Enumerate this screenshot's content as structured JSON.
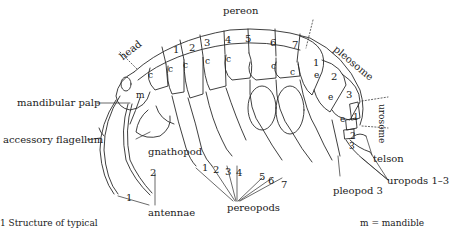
{
  "figure": {
    "region_labels": {
      "head": "head",
      "pereon": "pereon",
      "pleosome": "pleosome",
      "urosome": "urosome"
    },
    "pereon_segments": [
      "1",
      "2",
      "3",
      "4",
      "5",
      "6",
      "7"
    ],
    "coxa_marker": "c",
    "pleosome_segments": [
      "1",
      "2",
      "3"
    ],
    "epimeron_marker": "e",
    "urosome_segments": [
      "1",
      "2",
      "3"
    ],
    "mandible_marker": "m",
    "callouts": {
      "mandibular_palp": "mandibular palp",
      "accessory_flagellum": "accessory flagellum",
      "gnathopod": "gnathopod",
      "antennae": "antennae",
      "antenna_1": "1",
      "antenna_2": "2",
      "pereopods": "pereopods",
      "pereopod_numbers": [
        "1",
        "2",
        "3",
        "4",
        "5",
        "6",
        "7"
      ],
      "pleopod_3": "pleopod 3",
      "telson": "telson",
      "uropods": "uropods 1–3"
    },
    "caption_left": "1   Structure of typical",
    "caption_right": "m = mandible"
  }
}
